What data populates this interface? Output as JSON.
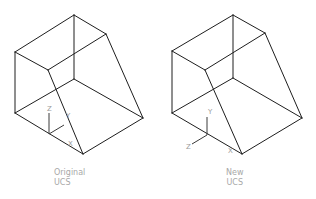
{
  "figure": {
    "panels": [
      {
        "id": "original",
        "caption_line1": "Original",
        "caption_line2": "UCS",
        "ucs_axes": {
          "z_label": "Z",
          "y_label": "Y",
          "x_label": "X"
        }
      },
      {
        "id": "new",
        "caption_line1": "New",
        "caption_line2": "UCS",
        "ucs_axes": {
          "y_label": "Y",
          "z_label": "Z",
          "x_label": "X"
        }
      }
    ],
    "colors": {
      "edge": "#1e1e1e",
      "label": "#a8a8a8"
    }
  }
}
